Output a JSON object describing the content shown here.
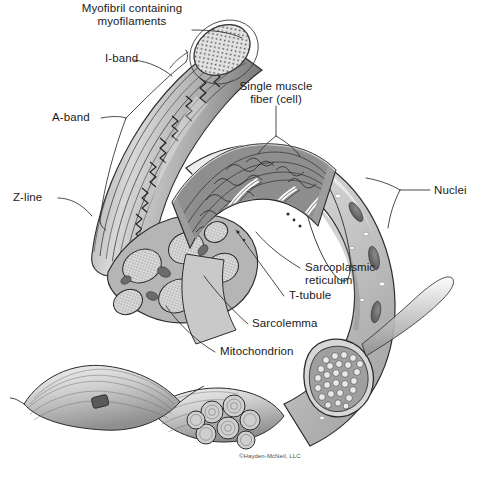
{
  "figure": {
    "background_color": "#ffffff",
    "ink_color": "#1a1a1a",
    "copyright": "©Hayden-McNeil, LLC"
  },
  "labels": {
    "myofibril": "Myofibril containing\nmyofilaments",
    "i_band": "I-band",
    "a_band": "A-band",
    "z_line": "Z-line",
    "single_fiber": "Single muscle\nfiber (cell)",
    "nuclei": "Nuclei",
    "sarcoplasmic_reticulum": "Sarcoplasmic\nreticulum",
    "t_tubule": "T-tubule",
    "sarcolemma": "Sarcolemma",
    "mitochondrion": "Mitochondrion"
  },
  "structures": [
    {
      "name": "myofibril-strand",
      "description": "Striated myofibril with sarcomere banding curving from upper right to lower left"
    },
    {
      "name": "myofibril-cross-section",
      "description": "Elliptical cut face of myofibril stippled with myofilament dots"
    },
    {
      "name": "muscle-fiber-body",
      "description": "Large curved cylindrical muscle fiber with sarcolemma surface and nuclei"
    },
    {
      "name": "cutaway-window",
      "description": "Opened section of fiber revealing myofibrils wrapped by sarcoplasmic reticulum and T-tubules"
    },
    {
      "name": "myofibril-bundle-cross-section",
      "description": "Cut end of fiber showing packed myofibril circles"
    },
    {
      "name": "fascicle-bundle",
      "description": "Bundle of seven fascicles at lower center"
    },
    {
      "name": "whole-muscle",
      "description": "Spindle-shaped whole muscle at lower left"
    }
  ],
  "palette": {
    "line": "#2b2b2b",
    "fill_light": "#e8e8e8",
    "fill_mid": "#c4c4c4",
    "fill_dark": "#8e8e8e",
    "fill_darker": "#6a6a6a",
    "white": "#ffffff"
  }
}
